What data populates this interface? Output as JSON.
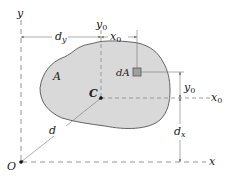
{
  "diagram": {
    "type": "parallel-axis-theorem-area",
    "colors": {
      "area_fill": "#d9d9d9",
      "outline": "#555555",
      "dashed_axes": "#888888",
      "dimension_lines": "#777777",
      "text": "#222222"
    },
    "labels": {
      "y_axis": "y",
      "x_axis": "x",
      "origin": "O",
      "centroid": "C",
      "area": "A",
      "element": "dA",
      "y0_axis": "y",
      "y0_sub": "0",
      "x0_axis": "x",
      "x0_sub": "0",
      "dim_dy": "d",
      "dim_dy_sub": "y",
      "dim_x0": "x",
      "dim_x0_sub": "0",
      "dim_y0": "y",
      "dim_y0_sub": "0",
      "dim_dx": "d",
      "dim_dx_sub": "x",
      "dim_d": "d"
    }
  }
}
